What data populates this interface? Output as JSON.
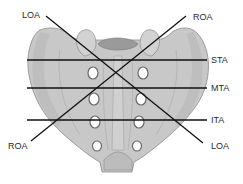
{
  "figure": {
    "colors": {
      "bone_fill": "#c8c8c8",
      "bone_shade": "#b4b4b4",
      "bone_outline": "#8a8a8a",
      "foramen_fill": "#ffffff",
      "canal_fill": "#9a9a9a",
      "line_color": "#111111",
      "text_color": "#2a2a2a"
    },
    "labels": {
      "loa_top": "LOA",
      "roa_top": "ROA",
      "sta": "STA",
      "mta": "MTA",
      "ita": "ITA",
      "roa_bottom": "ROA",
      "loa_bottom": "LOA"
    },
    "lines": [
      {
        "name": "LOA",
        "type": "oblique",
        "from": [
          46,
          16
        ],
        "to": [
          203,
          143
        ]
      },
      {
        "name": "ROA",
        "type": "oblique",
        "from": [
          186,
          16
        ],
        "to": [
          31,
          141
        ]
      },
      {
        "name": "STA",
        "type": "transverse",
        "y": 60
      },
      {
        "name": "MTA",
        "type": "transverse",
        "y": 88
      },
      {
        "name": "ITA",
        "type": "transverse",
        "y": 120
      }
    ]
  }
}
